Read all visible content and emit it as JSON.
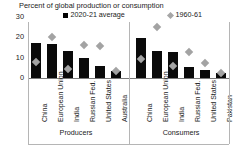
{
  "chart_data": {
    "type": "bar",
    "title": "Percent of global production or consumption",
    "xlabel": "",
    "ylabel": "",
    "ylim": [
      0,
      30
    ],
    "yticks": [
      0,
      10,
      20,
      30
    ],
    "grid": false,
    "legend_position": "top",
    "legend": [
      {
        "label": "2020-21 average",
        "marker": "square",
        "color": "#0a0a0a"
      },
      {
        "label": "1960-61",
        "marker": "diamond",
        "color": "#a3a3a3"
      }
    ],
    "groups": [
      {
        "name": "Producers",
        "categories": [
          "China",
          "European Union",
          "India",
          "Russian Fed.",
          "United States",
          "Australia"
        ],
        "series": [
          {
            "name": "2020-21 average",
            "values": [
              17.0,
              16.5,
              13.5,
              10.0,
              6.0,
              3.5
            ]
          },
          {
            "name": "1960-61",
            "values": [
              8.0,
              20.0,
              4.5,
              16.0,
              15.5,
              3.5
            ]
          }
        ]
      },
      {
        "name": "Consumers",
        "categories": [
          "China",
          "European Union",
          "India",
          "Russian Fed.",
          "United States",
          "Pakistan"
        ],
        "series": [
          {
            "name": "2020-21 average",
            "values": [
              19.5,
              13.5,
              13.0,
              5.5,
              4.0,
              2.5
            ]
          },
          {
            "name": "1960-61",
            "values": [
              9.5,
              25.0,
              6.0,
              13.0,
              7.5,
              2.5
            ]
          }
        ]
      }
    ]
  },
  "colors": {
    "bar": "#0a0a0a",
    "diamond": "#a3a3a3",
    "axis": "#7a7a7a",
    "rule": "#b5b5b5",
    "text": "#1a1a1a",
    "background": "#ffffff"
  }
}
